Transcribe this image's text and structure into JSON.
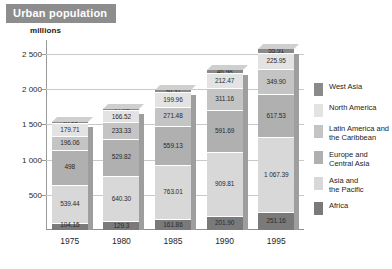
{
  "header": {
    "title": "Urban population",
    "title_bg": "#8d8d8d"
  },
  "axis": {
    "unit_label": "millions",
    "yticks": [
      "500",
      "1 000",
      "1 500",
      "2 000",
      "2 500"
    ]
  },
  "legend": {
    "items": [
      {
        "label": "West Asia",
        "color": "#8a8a8a"
      },
      {
        "label": "North America",
        "color": "#e3e3e3"
      },
      {
        "label": "Latin America and\nthe Caribbean",
        "color": "#c4c4c4"
      },
      {
        "label": "Europe and\nCentral Asia",
        "color": "#b0b0b0"
      },
      {
        "label": "Asia and\nthe Pacific",
        "color": "#d8d8d8"
      },
      {
        "label": "Africa",
        "color": "#7a7a7a"
      }
    ]
  },
  "chart_data": {
    "type": "bar",
    "stacked": true,
    "title": "Urban population",
    "xlabel": "",
    "ylabel": "millions",
    "ylim": [
      0,
      2700
    ],
    "yticks": [
      500,
      1000,
      1500,
      2000,
      2500
    ],
    "grid": true,
    "legend_position": "right",
    "categories": [
      "1975",
      "1980",
      "1985",
      "1990",
      "1995"
    ],
    "series": [
      {
        "name": "Africa",
        "color": "#7a7a7a",
        "values": [
          104.15,
          129.3,
          161.86,
          201.9,
          251.16
        ],
        "labels": [
          "104.15",
          "129.3",
          "161.86",
          "201.90",
          "251.16"
        ]
      },
      {
        "name": "Asia and the Pacific",
        "color": "#d8d8d8",
        "values": [
          539.44,
          640.3,
          763.01,
          909.81,
          1067.39
        ],
        "labels": [
          "539.44",
          "640.30",
          "763.01",
          "909.81",
          "1 067.39"
        ]
      },
      {
        "name": "Europe and Central Asia",
        "color": "#b0b0b0",
        "values": [
          498.0,
          529.82,
          559.13,
          591.69,
          617.53
        ],
        "labels": [
          "498",
          "529.82",
          "559.13",
          "591.69",
          "617.53"
        ]
      },
      {
        "name": "Latin America and the Caribbean",
        "color": "#c4c4c4",
        "values": [
          196.06,
          233.33,
          271.48,
          311.16,
          349.9
        ],
        "labels": [
          "196.06",
          "233.33",
          "271.48",
          "311.16",
          "349.90"
        ]
      },
      {
        "name": "North America",
        "color": "#e3e3e3",
        "values": [
          179.71,
          166.52,
          199.96,
          212.47,
          225.95
        ],
        "labels": [
          "179.71",
          "166.52",
          "199.96",
          "212.47",
          "225.95"
        ]
      },
      {
        "name": "West Asia",
        "color": "#8a8a8a",
        "values": [
          20.88,
          27.49,
          36.31,
          46.98,
          55.91
        ],
        "labels": [
          "20.88",
          "27.49",
          "36.31",
          "46.98",
          "55.91"
        ]
      }
    ]
  }
}
